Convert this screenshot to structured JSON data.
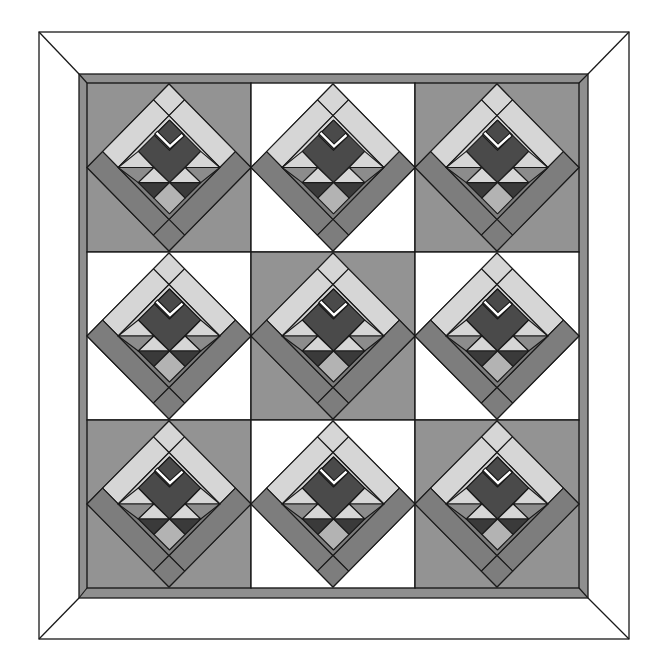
{
  "canvas": {
    "width": 657,
    "height": 659
  },
  "colors": {
    "background": "#ffffff",
    "outline": "#1a1a1a",
    "outer_frame_fill": "#ffffff",
    "inner_border": "#8f8f8f",
    "block_gray": "#939393",
    "block_white": "#ffffff",
    "light": "#d6d6d6",
    "medium_strip": "#7d7d7d",
    "medium_triangle": "#8c8c8c",
    "dark": "#4a4a4a",
    "dark_triangle": "#3a3a3a",
    "medium_light": "#b3b3b3",
    "accent_v": "#ffffff"
  },
  "frame": {
    "outer": {
      "x1": 39,
      "y1": 32,
      "x2": 629,
      "y2": 639
    },
    "inner_border_outer": {
      "x1": 79,
      "y1": 74,
      "x2": 588,
      "y2": 598
    },
    "inner_border_inner": {
      "x1": 87,
      "y1": 83,
      "x2": 579,
      "y2": 588
    }
  },
  "grid": {
    "cols": [
      87,
      251,
      415,
      579
    ],
    "rows": [
      83,
      252,
      420,
      588
    ],
    "backgrounds": [
      [
        "gray",
        "white",
        "gray"
      ],
      [
        "white",
        "gray",
        "white"
      ],
      [
        "gray",
        "white",
        "gray"
      ]
    ]
  },
  "block_pieces": [
    {
      "name": "diamond-base",
      "fill": "light",
      "points": [
        [
          81.5,
          1
        ],
        [
          163,
          84
        ],
        [
          81.5,
          167
        ],
        [
          0,
          84
        ]
      ]
    },
    {
      "name": "top-square",
      "fill": "light",
      "points": [
        [
          81.5,
          1
        ],
        [
          96.9,
          16.8
        ],
        [
          81.5,
          32.5
        ],
        [
          66.1,
          16.8
        ]
      ]
    },
    {
      "name": "left-wing",
      "fill": "light",
      "points": [
        [
          66.1,
          16.8
        ],
        [
          81.5,
          32.5
        ],
        [
          31,
          84
        ],
        [
          15.5,
          68.2
        ]
      ]
    },
    {
      "name": "right-wing",
      "fill": "light",
      "points": [
        [
          96.9,
          16.8
        ],
        [
          147.5,
          68.2
        ],
        [
          132,
          84
        ],
        [
          81.5,
          32.5
        ]
      ]
    },
    {
      "name": "left-medium-strip",
      "fill": "medium_strip",
      "points": [
        [
          15.5,
          68.2
        ],
        [
          81.5,
          135.5
        ],
        [
          66,
          151.2
        ],
        [
          0,
          84
        ]
      ]
    },
    {
      "name": "right-medium-strip",
      "fill": "medium_strip",
      "points": [
        [
          147.5,
          68.2
        ],
        [
          163,
          84
        ],
        [
          97,
          151.2
        ],
        [
          81.5,
          135.5
        ]
      ]
    },
    {
      "name": "bottom-square",
      "fill": "medium_strip",
      "points": [
        [
          81.5,
          135.5
        ],
        [
          97,
          151.2
        ],
        [
          81.5,
          167
        ],
        [
          66,
          151.2
        ]
      ]
    },
    {
      "name": "inner-square-upper",
      "fill": "light",
      "points": [
        [
          81.5,
          32.5
        ],
        [
          132,
          84
        ],
        [
          31,
          84
        ]
      ]
    },
    {
      "name": "inner-square-lower",
      "fill": "medium_strip",
      "points": [
        [
          31,
          84
        ],
        [
          132,
          84
        ],
        [
          81.5,
          135.5
        ]
      ]
    },
    {
      "name": "dark-diamond",
      "fill": "dark",
      "points": [
        [
          82,
          37
        ],
        [
          113,
          68
        ],
        [
          82,
          99
        ],
        [
          51,
          68
        ]
      ]
    },
    {
      "name": "small-dark-diamond",
      "fill": "dark",
      "points": [
        [
          82,
          37
        ],
        [
          97,
          52
        ],
        [
          82,
          67
        ],
        [
          67,
          52
        ]
      ]
    },
    {
      "name": "light-triangle-upper-left",
      "fill": "light",
      "points": [
        [
          51,
          68
        ],
        [
          66.5,
          84
        ],
        [
          31,
          84
        ]
      ]
    },
    {
      "name": "light-triangle-upper-right",
      "fill": "light",
      "points": [
        [
          113,
          68
        ],
        [
          132,
          84
        ],
        [
          97.5,
          84
        ]
      ]
    },
    {
      "name": "medium-triangle-left",
      "fill": "medium_triangle",
      "points": [
        [
          31,
          84
        ],
        [
          66.5,
          84
        ],
        [
          51,
          99
        ]
      ]
    },
    {
      "name": "medium-triangle-right",
      "fill": "medium_triangle",
      "points": [
        [
          97.5,
          84
        ],
        [
          132,
          84
        ],
        [
          113,
          99
        ]
      ]
    },
    {
      "name": "light-triangle-center-left",
      "fill": "light",
      "points": [
        [
          66.5,
          84
        ],
        [
          82,
          99
        ],
        [
          51,
          99
        ]
      ]
    },
    {
      "name": "light-triangle-center-right",
      "fill": "light",
      "points": [
        [
          97.5,
          84
        ],
        [
          113,
          99
        ],
        [
          82,
          99
        ]
      ]
    },
    {
      "name": "dark-triangle-left",
      "fill": "dark_triangle",
      "points": [
        [
          51,
          99
        ],
        [
          82,
          99
        ],
        [
          66.5,
          114.5
        ]
      ]
    },
    {
      "name": "dark-triangle-right",
      "fill": "dark_triangle",
      "points": [
        [
          82,
          99
        ],
        [
          113,
          99
        ],
        [
          97.5,
          114.5
        ]
      ]
    },
    {
      "name": "medium-light-diamond",
      "fill": "medium_light",
      "points": [
        [
          82,
          99
        ],
        [
          97.5,
          114.5
        ],
        [
          82,
          130
        ],
        [
          66.5,
          114.5
        ]
      ]
    }
  ],
  "block_v_mark": {
    "points": [
      [
        70,
        50.5
      ],
      [
        82.5,
        63
      ],
      [
        94,
        52.5
      ]
    ]
  }
}
